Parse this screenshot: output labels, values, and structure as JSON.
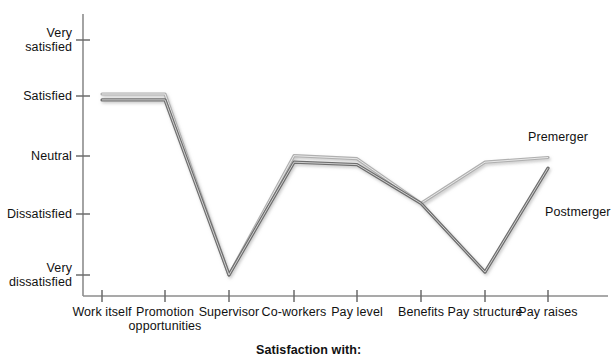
{
  "chart_data": {
    "type": "line",
    "title": "",
    "xlabel": "Satisfaction with:",
    "ylabel": "",
    "categories": [
      "Work itself",
      "Promotion opportunities",
      "Supervisor",
      "Co-workers",
      "Pay level",
      "Benefits",
      "Pay structure",
      "Pay raises"
    ],
    "category_lines": [
      [
        "Work",
        "itself"
      ],
      [
        "Promotion",
        "opportunities"
      ],
      [
        "Supervisor"
      ],
      [
        "Co-workers"
      ],
      [
        "Pay",
        "level"
      ],
      [
        "Benefits"
      ],
      [
        "Pay",
        "structure"
      ],
      [
        "Pay",
        "raises"
      ]
    ],
    "y_tick_labels": [
      "Very satisfied",
      "Satisfied",
      "Neutral",
      "Dissatisfied",
      "Very dissatisfied"
    ],
    "y_tick_lines": [
      [
        "Very",
        "satisfied"
      ],
      [
        "Satisfied"
      ],
      [
        "Neutral"
      ],
      [
        "Dissatisfied"
      ],
      [
        "Very",
        "dissatisfied"
      ]
    ],
    "y_tick_values": [
      5,
      4,
      3,
      2,
      1
    ],
    "ylim": [
      1,
      5
    ],
    "grid": false,
    "legend_position": "inline-right",
    "series": [
      {
        "name": "Premerger",
        "color": "#b0b0b0",
        "values": [
          4.08,
          4.08,
          1.0,
          3.03,
          2.98,
          2.22,
          2.92,
          3.0
        ]
      },
      {
        "name": "Postmerger",
        "color": "#6e6e6e",
        "values": [
          3.98,
          3.98,
          1.0,
          2.92,
          2.88,
          2.22,
          1.05,
          2.82
        ]
      }
    ],
    "annotations": [
      {
        "text": "Premerger",
        "x_category": "Pay raises",
        "placement": "above-right"
      },
      {
        "text": "Postmerger",
        "x_category": "Pay raises",
        "placement": "below-right"
      }
    ]
  },
  "axis": {
    "x_title": "Satisfaction with:"
  }
}
